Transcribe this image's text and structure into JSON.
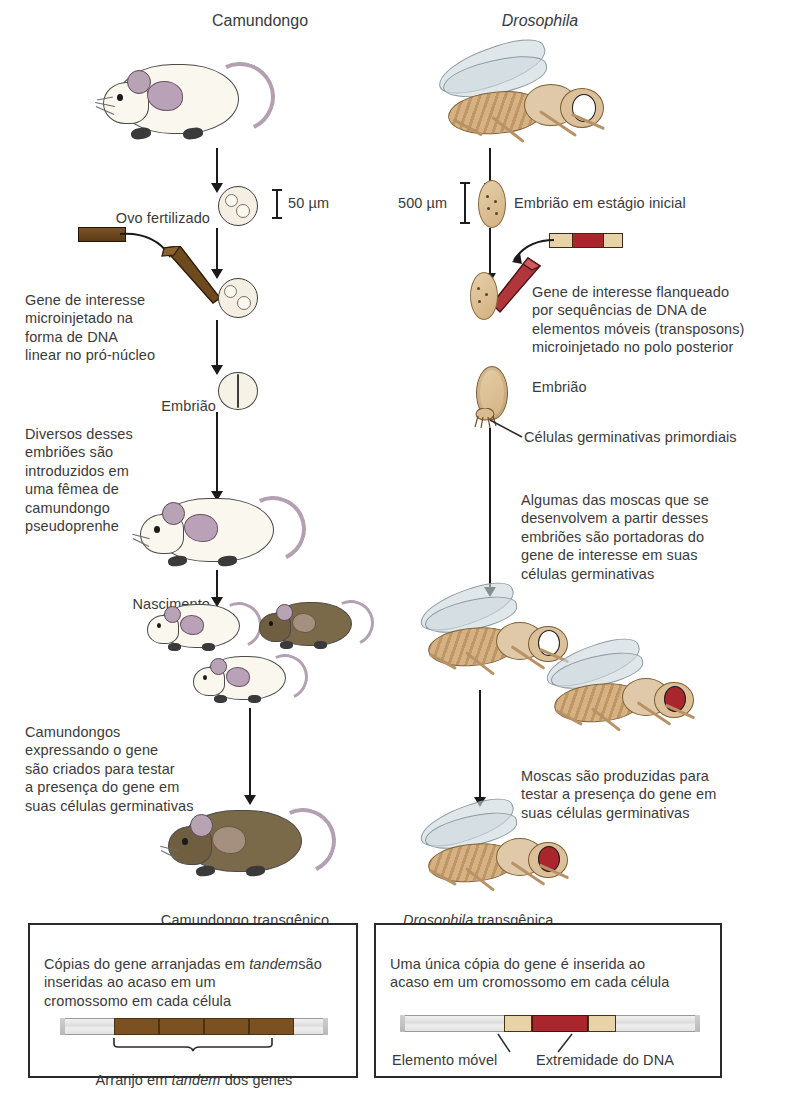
{
  "columns": {
    "left": {
      "title": "Camundongo",
      "steps": {
        "fertilized_egg": "Ovo fertilizado",
        "scale": "50 µm",
        "injection_caption": "Gene de interesse\nmicroinjetado na\nforma  de DNA\nlinear no pró-núcleo",
        "embryo": "Embrião",
        "transfer_caption": "Diversos desses\nembriões são\nintroduzidos em\numa fêmea de\ncamundongo\npseudoprenhe",
        "birth": "Nascimento",
        "breeding_caption": "Camundongos\nexpressando o gene\nsão criados para testar\na presença do gene em\nsuas células germinativas",
        "result": "Camundongo transgênico"
      },
      "panel": {
        "text": "Cópias do gene arranjadas em tandem\nsão inseridas ao acaso em um\ncromossomo em cada célula",
        "text_plain_1": "Cópias do gene arranjadas em ",
        "text_italic": "tandem",
        "text_plain_2": "são inseridas ao acaso em um\ncromossomo em cada célula",
        "gene_labels": "gene gene gene gene",
        "brace_label_1": "Arranjo em ",
        "brace_label_italic": "tandem",
        "brace_label_2": " dos genes",
        "segment_count": 4,
        "segment_color": "#7c5122"
      }
    },
    "right": {
      "title": "Drosophila",
      "title_italic": true,
      "steps": {
        "scale": "500 µm",
        "early_embryo": "Embrião em estágio inicial",
        "injection_caption": "Gene de interesse flanqueado\npor sequências de DNA de\nelementos móveis (transposons)\nmicroinjetado no polo posterior",
        "embryo": "Embrião",
        "germ_cells": "Células germinativas primordiais",
        "develop_caption": "Algumas das moscas que se\ndesenvolvem a partir desses\nembriões são portadoras do\ngene de interesse em suas\ncélulas germinativas",
        "breeding_caption": "Moscas são produzidas para\ntestar a presença do gene em\nsuas células germinativas",
        "result_italic": "Drosophila",
        "result_plain": " transgênica"
      },
      "panel": {
        "text": "Uma única cópia do gene é inserida ao\nacaso em um cromossomo em cada célula",
        "gene_label": "gene",
        "left_label": "Elemento móvel",
        "right_label": "Extremidade do DNA",
        "gene_color": "#a8262c",
        "flank_color": "#e8d3a8"
      }
    }
  },
  "colors": {
    "ink": "#2b2b2b",
    "text": "#3a3a3a",
    "arrow": "#1a1a1a",
    "mouse_white": "#faf7ee",
    "mouse_brown": "#7b6a49",
    "mouse_pink": "#b9a2b7",
    "fly_body": "#d5b184",
    "fly_eye_white": "#ffffff",
    "fly_eye_red": "#a8262c",
    "dna_brown": "#6b4a20",
    "dna_red": "#a8262c",
    "dna_tan": "#e8d3a8",
    "chromosome_gray": "#dcdcdc"
  },
  "icons": {
    "arrow": "down-arrow-icon",
    "scale": "scale-bar-icon",
    "pipette": "micropipette-icon",
    "mouse": "mouse-icon",
    "fly": "fly-icon",
    "egg": "egg-icon"
  }
}
